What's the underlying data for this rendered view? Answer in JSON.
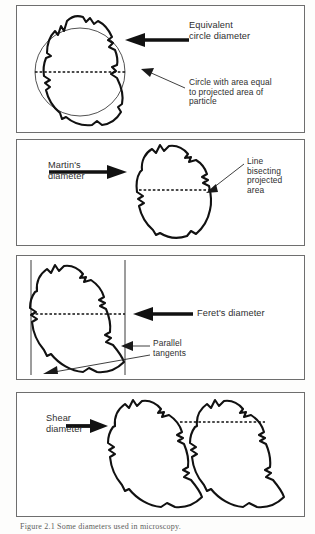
{
  "figure": {
    "caption": "Figure 2.1   Some diameters used in microscopy.",
    "panel_count": 4
  },
  "panels": [
    {
      "id": "equivalent-circle-diameter",
      "index": 1,
      "labels": [
        {
          "name": "equivalent-circle-diameter-label",
          "text": "Equivalent\ncircle diameter"
        },
        {
          "name": "circle-area-note-label",
          "text": "Circle with area equal\nto projected area of\nparticle"
        }
      ],
      "annotations": {
        "arrow_thick": "points left toward particle",
        "arrow_thin": "points left toward circle outline",
        "dashed_line": "equivalent circle diameter chord"
      },
      "shapes": [
        "irregular-particle-outline",
        "equivalent-circle-outline",
        "diameter-dashed-line"
      ]
    },
    {
      "id": "martins-diameter",
      "index": 2,
      "labels": [
        {
          "name": "martins-diameter-label",
          "text": "Martin's\ndiameter"
        },
        {
          "name": "bisecting-line-note-label",
          "text": "Line\nbisecting\nprojected\narea"
        }
      ],
      "annotations": {
        "arrow_thick": "points right toward particle",
        "arrow_thin": "points left-down toward dashed line",
        "dashed_line": "line bisecting projected area"
      },
      "shapes": [
        "irregular-particle-outline",
        "bisecting-dashed-line"
      ]
    },
    {
      "id": "ferets-diameter",
      "index": 3,
      "labels": [
        {
          "name": "ferets-diameter-label",
          "text": "Feret's diameter"
        },
        {
          "name": "parallel-tangents-label",
          "text": "Parallel\ntangents"
        }
      ],
      "annotations": {
        "arrow_thick": "points left toward particle",
        "arrow_thin_right": "points left toward right tangent",
        "arrow_thin_left": "points left-down toward left tangent",
        "dashed_line": "Feret's diameter between parallel tangents",
        "tangents": 2
      },
      "shapes": [
        "irregular-particle-outline",
        "left-tangent-line",
        "right-tangent-line",
        "feret-dashed-line"
      ]
    },
    {
      "id": "shear-diameter",
      "index": 4,
      "labels": [
        {
          "name": "shear-diameter-label",
          "text": "Shear\ndiameter"
        }
      ],
      "annotations": {
        "arrow_thick": "points right toward particles",
        "dashed_line": "shear diameter between two particle positions"
      },
      "shapes": [
        "irregular-particle-outline-left",
        "irregular-particle-outline-right",
        "shear-dashed-line"
      ]
    }
  ],
  "colors": {
    "ink": "#1a1a1a",
    "panel_border": "#6e6e6e",
    "text": "#2e2e2e",
    "caption_text": "#5d5d5d",
    "page_background": "#fdfdfc",
    "thin_line": "#3a3a3a"
  }
}
